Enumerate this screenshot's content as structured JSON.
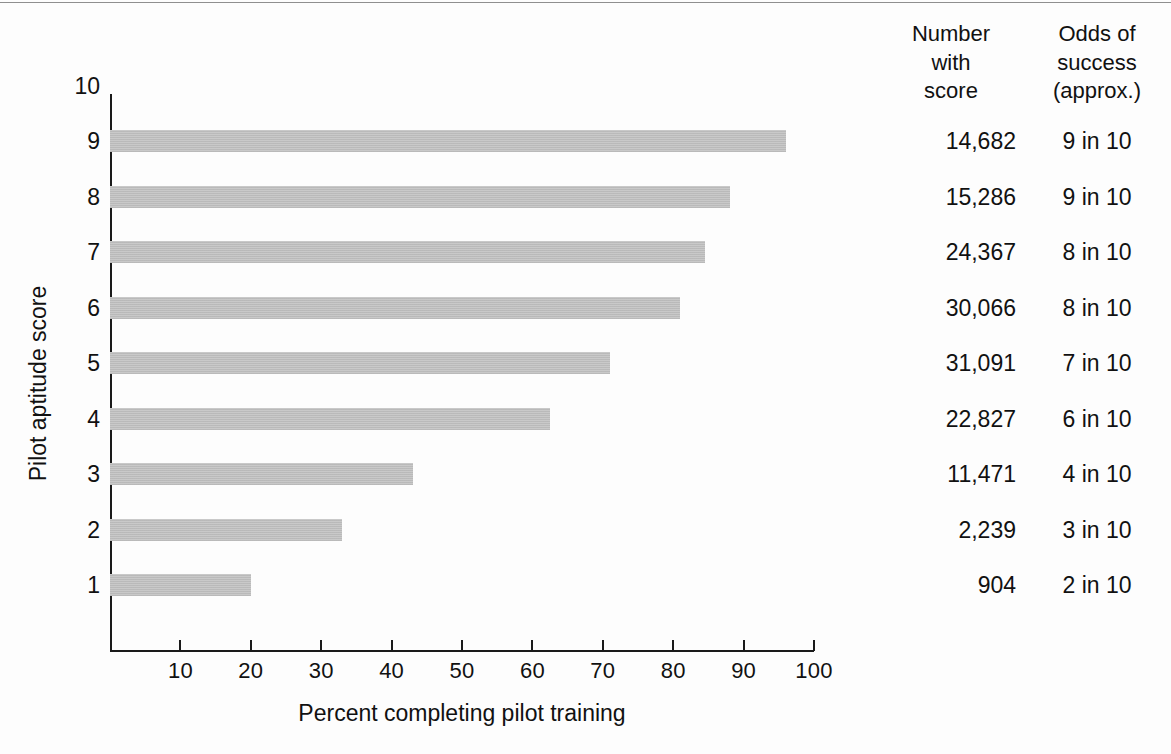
{
  "chart_data": {
    "type": "bar",
    "orientation": "horizontal",
    "title": "",
    "xlabel": "Percent completing pilot training",
    "ylabel": "Pilot aptitude score",
    "categories": [
      "9",
      "8",
      "7",
      "6",
      "5",
      "4",
      "3",
      "2",
      "1"
    ],
    "values": [
      96,
      88,
      84.5,
      81,
      71,
      62.5,
      43,
      33,
      20
    ],
    "xlim": [
      0,
      100
    ],
    "ylim": [
      0,
      10
    ],
    "xticks": [
      10,
      20,
      30,
      40,
      50,
      60,
      70,
      80,
      90,
      100
    ],
    "yticks": [
      "10",
      "9",
      "8",
      "7",
      "6",
      "5",
      "4",
      "3",
      "2",
      "1"
    ],
    "grid": false,
    "legend": false,
    "bar_color": "#c9c9c9",
    "axis_color": "#1a1a1a",
    "series": [
      {
        "name": "Percent completing pilot training",
        "values": [
          96,
          88,
          84.5,
          81,
          71,
          62.5,
          43,
          33,
          20
        ]
      }
    ],
    "table": {
      "headers": [
        "Number with score",
        "Odds of success (approx.)"
      ],
      "rows": [
        {
          "score": "9",
          "number_with_score": "14,682",
          "odds_of_success": "9 in 10"
        },
        {
          "score": "8",
          "number_with_score": "15,286",
          "odds_of_success": "9 in 10"
        },
        {
          "score": "7",
          "number_with_score": "24,367",
          "odds_of_success": "8 in 10"
        },
        {
          "score": "6",
          "number_with_score": "30,066",
          "odds_of_success": "8 in 10"
        },
        {
          "score": "5",
          "number_with_score": "31,091",
          "odds_of_success": "7 in 10"
        },
        {
          "score": "4",
          "number_with_score": "22,827",
          "odds_of_success": "6 in 10"
        },
        {
          "score": "3",
          "number_with_score": "11,471",
          "odds_of_success": "4 in 10"
        },
        {
          "score": "2",
          "number_with_score": "2,239",
          "odds_of_success": "3 in 10"
        },
        {
          "score": "1",
          "number_with_score": "904",
          "odds_of_success": "2 in 10"
        }
      ]
    }
  },
  "axes": {
    "x_title": "Percent completing pilot training",
    "y_title": "Pilot aptitude score",
    "x_tick_labels": [
      "10",
      "20",
      "30",
      "40",
      "50",
      "60",
      "70",
      "80",
      "90",
      "100"
    ],
    "y_tick_labels": [
      "10",
      "9",
      "8",
      "7",
      "6",
      "5",
      "4",
      "3",
      "2",
      "1"
    ]
  },
  "table_headers": {
    "number_line1": "Number",
    "number_line2": "with",
    "number_line3": "score",
    "odds_line1": "Odds of",
    "odds_line2": "success",
    "odds_line3": "(approx.)"
  },
  "rows": [
    {
      "number": "14,682",
      "odds": "9 in 10"
    },
    {
      "number": "15,286",
      "odds": "9 in 10"
    },
    {
      "number": "24,367",
      "odds": "8 in 10"
    },
    {
      "number": "30,066",
      "odds": "8 in 10"
    },
    {
      "number": "31,091",
      "odds": "7 in 10"
    },
    {
      "number": "22,827",
      "odds": "6 in 10"
    },
    {
      "number": "11,471",
      "odds": "4 in 10"
    },
    {
      "number": "2,239",
      "odds": "3 in 10"
    },
    {
      "number": "904",
      "odds": "2 in 10"
    }
  ]
}
